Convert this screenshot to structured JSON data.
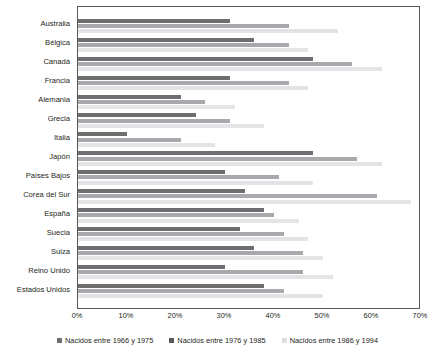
{
  "chart_data": {
    "type": "bar",
    "orientation": "horizontal",
    "title": "",
    "xlabel": "",
    "ylabel": "",
    "xlim": [
      0,
      70
    ],
    "xtick_labels": [
      "0%",
      "10%",
      "20%",
      "30%",
      "40%",
      "50%",
      "60%",
      "70%"
    ],
    "xticks": [
      0,
      10,
      20,
      30,
      40,
      50,
      60,
      70
    ],
    "grid": false,
    "legend_position": "bottom",
    "categories": [
      "Australia",
      "Bélgica",
      "Canadá",
      "Francia",
      "Alemania",
      "Grecia",
      "Italia",
      "Japón",
      "Países Bajos",
      "Corea del Sur",
      "España",
      "Suecia",
      "Suiza",
      "Reino Unido",
      "Estados Unidos"
    ],
    "series": [
      {
        "name": "Nacidos entre 1966 y 1975",
        "color": "#6d6e70",
        "values": [
          31,
          36,
          48,
          31,
          21,
          24,
          10,
          48,
          30,
          34,
          38,
          33,
          36,
          30,
          38
        ]
      },
      {
        "name": "Nacidos entre 1976 y 1985",
        "color": "#a7a9ac",
        "values": [
          43,
          43,
          56,
          43,
          26,
          31,
          21,
          57,
          41,
          61,
          40,
          42,
          46,
          46,
          42
        ]
      },
      {
        "name": "Nacidos entre 1986 y 1994",
        "color": "#e3e4e5",
        "values": [
          53,
          47,
          62,
          47,
          32,
          38,
          28,
          62,
          48,
          68,
          45,
          47,
          50,
          52,
          50
        ]
      }
    ]
  }
}
